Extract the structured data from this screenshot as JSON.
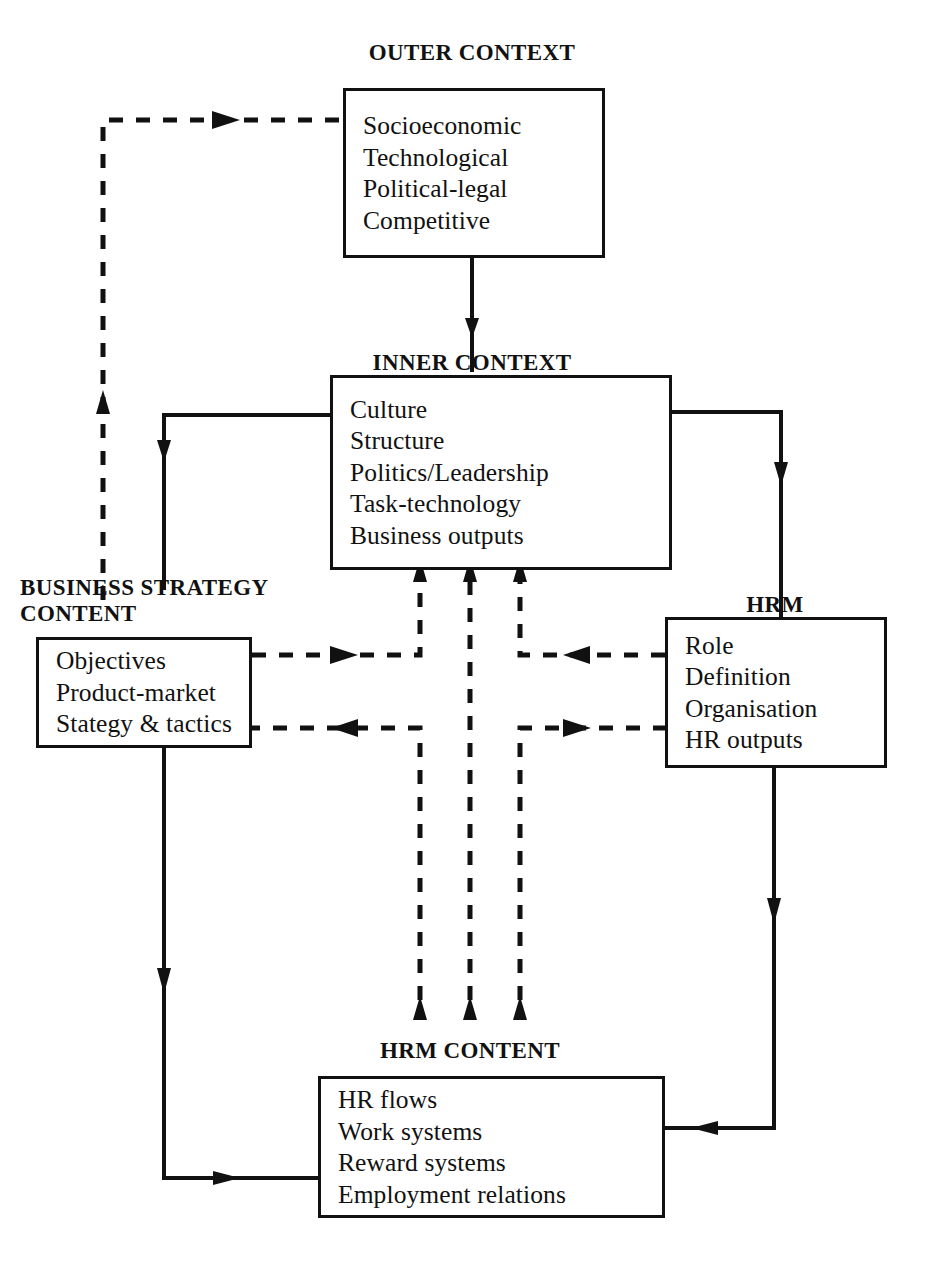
{
  "diagram": {
    "stroke_color": "#111111",
    "background_color": "#ffffff",
    "boxes": [
      {
        "id": "outer-context",
        "caption": "OUTER CONTEXT",
        "items": [
          "Socioeconomic",
          "Technological",
          "Political-legal",
          "Competitive"
        ]
      },
      {
        "id": "inner-context",
        "caption": "INNER CONTEXT",
        "items": [
          "Culture",
          "Structure",
          "Politics/Leadership",
          "Task-technology",
          "Business outputs"
        ]
      },
      {
        "id": "business-strategy-content",
        "caption": "BUSINESS STRATEGY\nCONTENT",
        "items": [
          "Objectives",
          "Product-market",
          "Stategy & tactics"
        ]
      },
      {
        "id": "hrm-context",
        "caption": "HRM CONTEXT",
        "items": [
          "Role",
          "Definition",
          "Organisation",
          "HR outputs"
        ]
      },
      {
        "id": "hrm-content",
        "caption": "HRM CONTENT",
        "items": [
          "HR flows",
          "Work systems",
          "Reward systems",
          "Employment relations"
        ]
      }
    ],
    "connectors": [
      {
        "id": "outer-to-inner",
        "style": "solid",
        "from": "outer-context",
        "to": "inner-context"
      },
      {
        "id": "inner-to-business-strategy",
        "style": "solid",
        "from": "inner-context",
        "to": "business-strategy-content"
      },
      {
        "id": "inner-to-hrm-context",
        "style": "solid",
        "from": "inner-context",
        "to": "hrm-context"
      },
      {
        "id": "business-strategy-to-hrm-content",
        "style": "solid",
        "from": "business-strategy-content",
        "to": "hrm-content"
      },
      {
        "id": "hrm-context-to-hrm-content",
        "style": "solid",
        "from": "hrm-context",
        "to": "hrm-content"
      },
      {
        "id": "feedback-to-outer-context",
        "style": "dashed",
        "from": "business-strategy-content",
        "to": "outer-context"
      },
      {
        "id": "business-strategy-to-inner",
        "style": "dashed",
        "from": "business-strategy-content",
        "to": "inner-context"
      },
      {
        "id": "hrm-context-to-inner",
        "style": "dashed",
        "from": "hrm-context",
        "to": "inner-context"
      },
      {
        "id": "hrm-content-to-inner",
        "style": "dashed",
        "from": "hrm-content",
        "to": "inner-context"
      },
      {
        "id": "hrm-content-to-business-strategy",
        "style": "dashed",
        "from": "hrm-content",
        "to": "business-strategy-content"
      },
      {
        "id": "hrm-content-to-hrm-context",
        "style": "dashed",
        "from": "hrm-content",
        "to": "hrm-context"
      }
    ]
  }
}
